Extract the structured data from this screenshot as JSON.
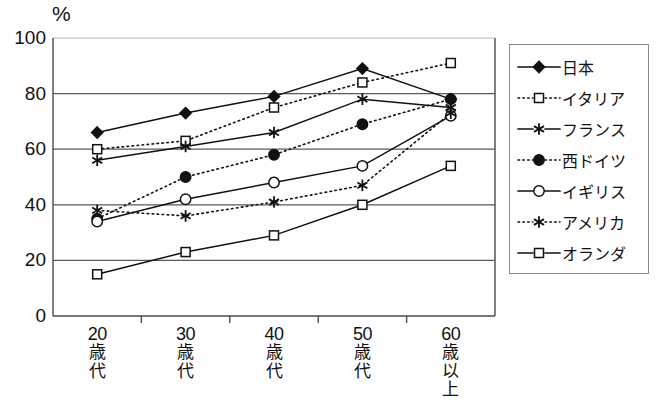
{
  "chart_data": {
    "type": "line",
    "title": "",
    "subtitle": "",
    "xlabel": "",
    "ylabel": "%",
    "unit_label": "%",
    "categories": [
      "20歳代",
      "30歳代",
      "40歳代",
      "50歳代",
      "60歳以上"
    ],
    "category_parts": [
      {
        "num": "20",
        "chars": [
          "歳",
          "代"
        ]
      },
      {
        "num": "30",
        "chars": [
          "歳",
          "代"
        ]
      },
      {
        "num": "40",
        "chars": [
          "歳",
          "代"
        ]
      },
      {
        "num": "50",
        "chars": [
          "歳",
          "代"
        ]
      },
      {
        "num": "60",
        "chars": [
          "歳",
          "以",
          "上"
        ]
      }
    ],
    "ylim": [
      0,
      100
    ],
    "yticks": [
      0,
      20,
      40,
      60,
      80,
      100
    ],
    "ytick_labels": [
      "0",
      "20",
      "40",
      "60",
      "80",
      "100"
    ],
    "grid": true,
    "grid_axis": "y",
    "legend_position": "right",
    "series": [
      {
        "name": "日本",
        "marker": "filled-diamond",
        "line": "solid",
        "values": [
          66,
          73,
          79,
          89,
          78
        ]
      },
      {
        "name": "イタリア",
        "marker": "open-square",
        "line": "dotted",
        "values": [
          60,
          63,
          75,
          84,
          91
        ]
      },
      {
        "name": "フランス",
        "marker": "asterisk",
        "line": "solid",
        "values": [
          56,
          61,
          66,
          78,
          75
        ]
      },
      {
        "name": "西ドイツ",
        "marker": "filled-circle",
        "line": "dotted",
        "values": [
          35,
          50,
          58,
          69,
          78
        ]
      },
      {
        "name": "イギリス",
        "marker": "open-circle",
        "line": "solid",
        "values": [
          34,
          42,
          48,
          54,
          72
        ]
      },
      {
        "name": "アメリカ",
        "marker": "asterisk",
        "line": "dotted",
        "values": [
          38,
          36,
          41,
          47,
          73
        ]
      },
      {
        "name": "オランダ",
        "marker": "open-square",
        "line": "solid",
        "values": [
          15,
          23,
          29,
          40,
          54
        ]
      }
    ]
  },
  "legend": {
    "items": [
      {
        "label": "日本"
      },
      {
        "label": "イタリア"
      },
      {
        "label": "フランス"
      },
      {
        "label": "西ドイツ"
      },
      {
        "label": "イギリス"
      },
      {
        "label": "アメリカ"
      },
      {
        "label": "オランダ"
      }
    ]
  },
  "colors": {
    "ink": "#111111",
    "grid": "#5a5a5a",
    "axis": "#4a4a4a",
    "background": "#ffffff"
  }
}
